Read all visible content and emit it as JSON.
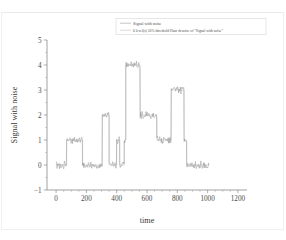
{
  "chart_data": {
    "type": "line",
    "title": "",
    "xlabel": "time",
    "ylabel": "Signal with noise",
    "xlim": [
      -60,
      1260
    ],
    "ylim": [
      -1,
      5
    ],
    "xticks": [
      0,
      200,
      400,
      600,
      800,
      1000,
      1200
    ],
    "xticklabels": [
      "0",
      "200",
      "400",
      "600",
      "800",
      "1000",
      "1200"
    ],
    "yticks": [
      -1,
      0,
      1,
      2,
      3,
      4,
      5
    ],
    "yticklabels": [
      "−1",
      "0",
      "1",
      "2",
      "3",
      "4",
      "5"
    ],
    "grid": false,
    "legend_position": "top-center",
    "series": [
      {
        "name": "Signal with noise",
        "color": "#8e8e8e",
        "style": "noisy-steps"
      },
      {
        "name": "6 level(s) 50% threshold Haar denoise of \"Signal with noise\"",
        "color": "#b9b9b9",
        "style": "steps"
      }
    ],
    "blocks": [
      {
        "x_start": 0,
        "x_end": 70,
        "level": 0
      },
      {
        "x_start": 70,
        "x_end": 175,
        "level": 1
      },
      {
        "x_start": 175,
        "x_end": 305,
        "level": 0
      },
      {
        "x_start": 305,
        "x_end": 350,
        "level": 2
      },
      {
        "x_start": 350,
        "x_end": 400,
        "level": 0
      },
      {
        "x_start": 400,
        "x_end": 420,
        "level": 1
      },
      {
        "x_start": 420,
        "x_end": 450,
        "level": 0
      },
      {
        "x_start": 450,
        "x_end": 460,
        "level": 1
      },
      {
        "x_start": 460,
        "x_end": 555,
        "level": 4
      },
      {
        "x_start": 555,
        "x_end": 665,
        "level": 2
      },
      {
        "x_start": 665,
        "x_end": 760,
        "level": 1
      },
      {
        "x_start": 760,
        "x_end": 845,
        "level": 3
      },
      {
        "x_start": 845,
        "x_end": 862,
        "level": 1
      },
      {
        "x_start": 862,
        "x_end": 1010,
        "level": 0
      }
    ],
    "noise_amplitude": 0.12,
    "x_data_end": 1010
  },
  "figure": {
    "axis_title_x": "time",
    "axis_title_y": "Signal with noise"
  },
  "legend": {
    "entries": [
      {
        "label": "Signal with noise"
      },
      {
        "label": "6 level(s) 50% threshold Haar denoise of \"Signal with noise\""
      }
    ]
  }
}
